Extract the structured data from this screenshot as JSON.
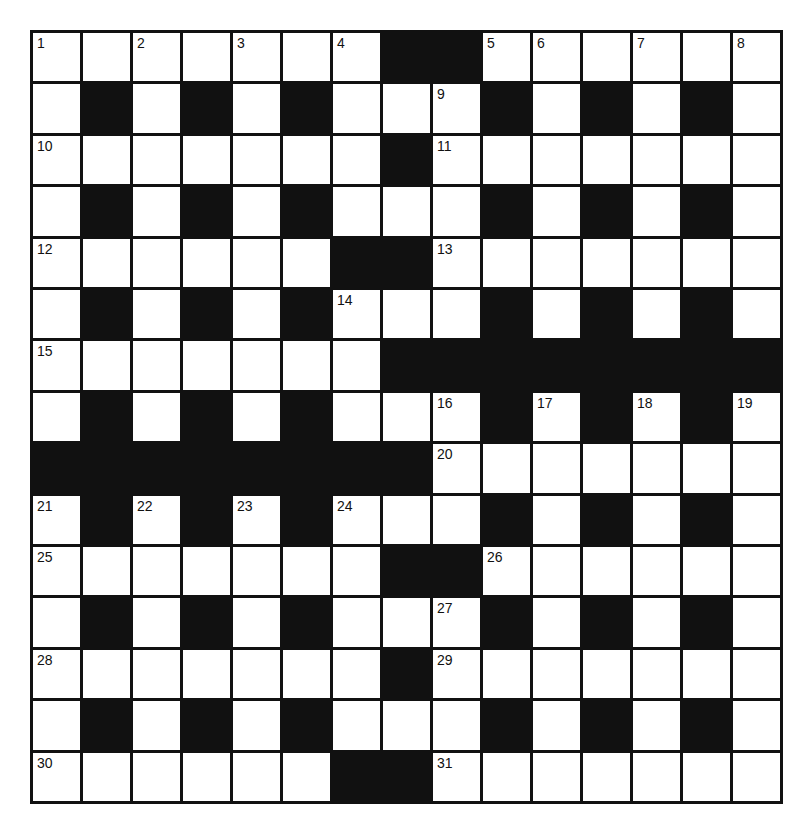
{
  "puzzle": {
    "rows": 15,
    "cols": 15,
    "colors": {
      "block": "#111111",
      "cell": "#ffffff",
      "border": "#111111"
    },
    "layout": [
      ".......##......",
      ".#.#.#...#.#.#.",
      ".......#.......",
      ".#.#.#...#.#.#.",
      "......##.......",
      ".#.#.#...#.#.#.",
      ".......########",
      ".#.#.#...#.#.#.",
      "########.......",
      ".#.#.#...#.#.#.",
      ".......##......",
      ".#.#.#...#.#.#.",
      ".......#.......",
      ".#.#.#...#.#.#.",
      "......##......."
    ],
    "numbers": [
      {
        "row": 0,
        "col": 0,
        "n": "1"
      },
      {
        "row": 0,
        "col": 2,
        "n": "2"
      },
      {
        "row": 0,
        "col": 4,
        "n": "3"
      },
      {
        "row": 0,
        "col": 6,
        "n": "4"
      },
      {
        "row": 0,
        "col": 9,
        "n": "5"
      },
      {
        "row": 0,
        "col": 10,
        "n": "6"
      },
      {
        "row": 0,
        "col": 12,
        "n": "7"
      },
      {
        "row": 0,
        "col": 14,
        "n": "8"
      },
      {
        "row": 1,
        "col": 8,
        "n": "9"
      },
      {
        "row": 2,
        "col": 0,
        "n": "10"
      },
      {
        "row": 2,
        "col": 8,
        "n": "11"
      },
      {
        "row": 4,
        "col": 0,
        "n": "12"
      },
      {
        "row": 4,
        "col": 8,
        "n": "13"
      },
      {
        "row": 5,
        "col": 6,
        "n": "14"
      },
      {
        "row": 6,
        "col": 0,
        "n": "15"
      },
      {
        "row": 7,
        "col": 8,
        "n": "16"
      },
      {
        "row": 7,
        "col": 10,
        "n": "17"
      },
      {
        "row": 7,
        "col": 12,
        "n": "18"
      },
      {
        "row": 7,
        "col": 14,
        "n": "19"
      },
      {
        "row": 8,
        "col": 8,
        "n": "20"
      },
      {
        "row": 9,
        "col": 0,
        "n": "21"
      },
      {
        "row": 9,
        "col": 2,
        "n": "22"
      },
      {
        "row": 9,
        "col": 4,
        "n": "23"
      },
      {
        "row": 9,
        "col": 6,
        "n": "24"
      },
      {
        "row": 10,
        "col": 0,
        "n": "25"
      },
      {
        "row": 10,
        "col": 9,
        "n": "26"
      },
      {
        "row": 11,
        "col": 8,
        "n": "27"
      },
      {
        "row": 12,
        "col": 0,
        "n": "28"
      },
      {
        "row": 12,
        "col": 8,
        "n": "29"
      },
      {
        "row": 14,
        "col": 0,
        "n": "30"
      },
      {
        "row": 14,
        "col": 8,
        "n": "31"
      }
    ]
  }
}
